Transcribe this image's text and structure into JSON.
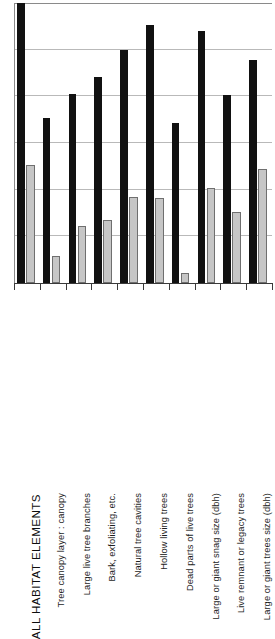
{
  "chart_data": {
    "type": "bar",
    "title": "",
    "subtitle": "",
    "xlabel": "",
    "ylabel": "",
    "grid": true,
    "gridlines_count": 5,
    "legend_position": "none",
    "ylim": [
      0,
      6
    ],
    "yticks": [
      0,
      1,
      2,
      3,
      4,
      5,
      6
    ],
    "ytick_labels": [
      "",
      "",
      "",
      "",
      "",
      "",
      ""
    ],
    "categories": [
      "ALL HABITAT  ELEMENTS",
      "Tree canopy layer : canopy",
      "Large live tree branches",
      "Bark, exfoliating, etc.",
      "Natural tree cavities",
      "Hollow living trees",
      "Dead parts of live trees",
      "Large or giant snag size (dbh)",
      "Live remnant or legacy trees",
      "Large or giant trees size (dbh)"
    ],
    "series": [
      {
        "name": "dark-series",
        "color": "#111111",
        "values": [
          6.0,
          3.53,
          4.05,
          4.42,
          5.0,
          5.53,
          3.43,
          5.4,
          4.02,
          4.77
        ]
      },
      {
        "name": "light-series",
        "color": "#c6c6c6",
        "values": [
          2.53,
          0.57,
          1.22,
          1.35,
          1.84,
          1.82,
          0.21,
          2.03,
          1.52,
          2.45
        ]
      }
    ]
  },
  "axis": {
    "baseline_color": "#3a3a3a",
    "grid_color": "#b9b9b9",
    "frame_color": "#8a8a8a"
  }
}
